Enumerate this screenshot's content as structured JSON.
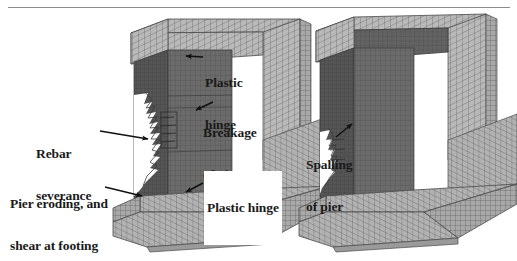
{
  "figure": {
    "type": "finite-element-mesh-illustration",
    "background_color": "#ffffff",
    "text_color": "#1a1a1a",
    "mesh_light_color": "#b4b4b4",
    "mesh_dark_color": "#6e6e6e",
    "mesh_line_color": "#4a4a4a",
    "rule_color": "#8c8c8c"
  },
  "annotations": [
    {
      "id": "plastic-hinge-top",
      "line1": "Plastic",
      "line2": "hinge",
      "boxed": false
    },
    {
      "id": "breakage-of-pier",
      "line1": "Breakage",
      "line2": "of pier",
      "boxed": false
    },
    {
      "id": "rebar-severance",
      "line1": "Rebar",
      "line2": "severance",
      "boxed": false
    },
    {
      "id": "pier-eroding",
      "line1": "Pier eroding, and",
      "line2": "shear at footing",
      "boxed": false
    },
    {
      "id": "plastic-hinge-base",
      "line1": "Plastic hinge",
      "line2": "",
      "boxed": true
    },
    {
      "id": "spalling-of-pier",
      "line1": "Spalling",
      "line2": "of pier",
      "boxed": false
    }
  ],
  "models": [
    {
      "id": "left-model",
      "description": "Damaged bridge pier frame, eroded pier with exposed rebar"
    },
    {
      "id": "right-model",
      "description": "Bridge pier frame with spalling at pier base"
    }
  ]
}
